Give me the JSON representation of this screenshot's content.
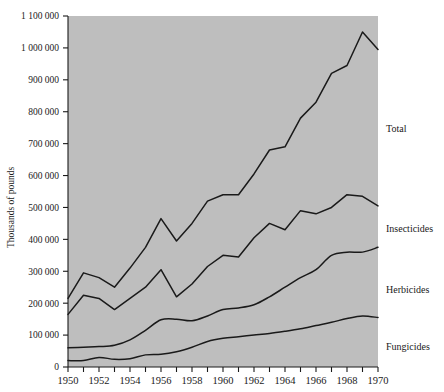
{
  "chart_data": {
    "type": "line",
    "title": "",
    "xlabel": "",
    "ylabel": "Thousands of pounds",
    "xlim": [
      1950,
      1970
    ],
    "ylim": [
      0,
      1100000
    ],
    "grid": false,
    "legend_position": "right-inline",
    "plot_background": "#bebebe",
    "line_color": "#1a1a1a",
    "x": [
      1950,
      1951,
      1952,
      1953,
      1954,
      1955,
      1956,
      1957,
      1958,
      1959,
      1960,
      1961,
      1962,
      1963,
      1964,
      1965,
      1966,
      1967,
      1968,
      1969,
      1970
    ],
    "xticks": [
      1950,
      1951,
      1952,
      1953,
      1954,
      1955,
      1956,
      1957,
      1958,
      1959,
      1960,
      1961,
      1962,
      1963,
      1964,
      1965,
      1966,
      1967,
      1968,
      1969,
      1970
    ],
    "xticklabels": [
      "1950",
      "",
      "1952",
      "",
      "1954",
      "",
      "1956",
      "",
      "1958",
      "",
      "1960",
      "",
      "1962",
      "",
      "1964",
      "",
      "1966",
      "",
      "1968",
      "",
      "1970"
    ],
    "xticklabels_shown": [
      "1950",
      "1952",
      "1954",
      "1956",
      "1958",
      "1960",
      "1962",
      "1964",
      "1966",
      "1968",
      "1970"
    ],
    "yticks": [
      0,
      100000,
      200000,
      300000,
      400000,
      500000,
      600000,
      700000,
      800000,
      900000,
      1000000,
      1100000
    ],
    "yticklabels": [
      "0",
      "100 000",
      "200 000",
      "300 000",
      "400 000",
      "500 000",
      "600 000",
      "700 000",
      "800 000",
      "900 000",
      "1 000 000",
      "1 100 000"
    ],
    "series": [
      {
        "name": "Total",
        "label": "Total",
        "values": [
          215000,
          295000,
          280000,
          250000,
          310000,
          375000,
          465000,
          395000,
          450000,
          520000,
          540000,
          540000,
          605000,
          680000,
          690000,
          780000,
          830000,
          920000,
          945000,
          1050000,
          995000
        ]
      },
      {
        "name": "Insecticides",
        "label": "Insecticides",
        "values": [
          165000,
          225000,
          215000,
          180000,
          215000,
          250000,
          305000,
          220000,
          260000,
          315000,
          350000,
          345000,
          405000,
          450000,
          430000,
          490000,
          480000,
          500000,
          540000,
          535000,
          505000
        ]
      },
      {
        "name": "Herbicides",
        "label": "Herbicides",
        "values": [
          60000,
          62000,
          64000,
          68000,
          85000,
          115000,
          148000,
          150000,
          145000,
          160000,
          180000,
          185000,
          195000,
          220000,
          250000,
          280000,
          305000,
          350000,
          360000,
          360000,
          375000
        ]
      },
      {
        "name": "Fungicides",
        "label": "Fungicides",
        "values": [
          20000,
          20000,
          30000,
          24000,
          26000,
          38000,
          40000,
          48000,
          62000,
          80000,
          90000,
          95000,
          100000,
          105000,
          112000,
          120000,
          130000,
          140000,
          152000,
          160000,
          155000
        ]
      }
    ]
  },
  "axis": {
    "ylabel": "Thousands of pounds"
  }
}
